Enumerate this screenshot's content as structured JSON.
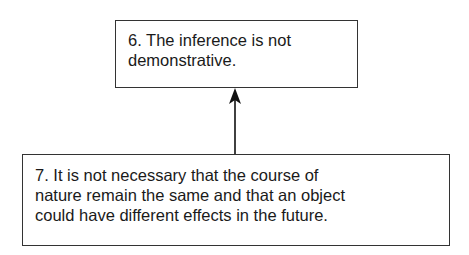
{
  "diagram": {
    "nodes": [
      {
        "id": "6",
        "lines": [
          "6. The inference is not",
          "demonstrative."
        ]
      },
      {
        "id": "7",
        "lines": [
          "7. It is not necessary that the course of",
          "nature remain the same and that an object",
          "could have different effects in the future."
        ]
      }
    ],
    "edges": [
      {
        "from": "7",
        "to": "6",
        "type": "arrow"
      }
    ]
  }
}
